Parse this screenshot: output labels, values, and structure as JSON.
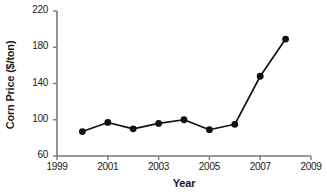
{
  "chart_data": {
    "type": "line",
    "title": "",
    "xlabel": "Year",
    "ylabel": "Corn Price ($/ton)",
    "x": [
      2000,
      2001,
      2002,
      2003,
      2004,
      2005,
      2006,
      2007,
      2008
    ],
    "values": [
      87,
      97,
      90,
      96,
      100,
      89,
      95,
      148,
      189
    ],
    "series": [
      {
        "name": "Corn Price",
        "values": [
          87,
          97,
          90,
          96,
          100,
          89,
          95,
          148,
          189
        ]
      }
    ],
    "xlim": [
      1999,
      2009
    ],
    "ylim": [
      60,
      220
    ],
    "xticks": [
      "1999",
      "2001",
      "2003",
      "2005",
      "2007",
      "2009"
    ],
    "xtick_values": [
      1999,
      2001,
      2003,
      2005,
      2007,
      2009
    ],
    "yticks": [
      "60",
      "100",
      "140",
      "180",
      "220"
    ],
    "ytick_values": [
      60,
      100,
      140,
      180,
      220
    ],
    "grid": false,
    "legend": false,
    "legend_position": "none",
    "marker": "filled-circle",
    "line_color": "#111111",
    "marker_color": "#111111",
    "axis_color": "#6e6e6e",
    "background_color": "#ffffff"
  }
}
